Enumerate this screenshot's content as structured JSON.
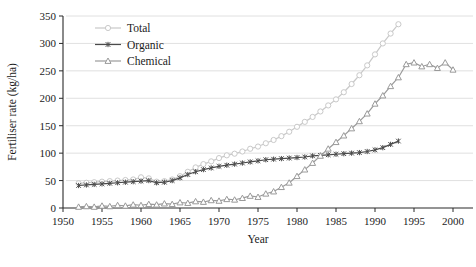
{
  "chart_data": {
    "type": "line",
    "title": "",
    "xlabel": "Year",
    "ylabel": "Fertiliser rate (kg/ha)",
    "xlim": [
      1950,
      2000
    ],
    "ylim": [
      0,
      350
    ],
    "xticks": [
      1950,
      1955,
      1960,
      1965,
      1970,
      1975,
      1980,
      1985,
      1990,
      1995,
      2000
    ],
    "yticks": [
      0,
      50,
      100,
      150,
      200,
      250,
      300,
      350
    ],
    "grid": "horizontal",
    "legend_position": "top-left",
    "series": [
      {
        "name": "Total",
        "color": "#c9c9c9",
        "marker": "circle",
        "x": [
          1952,
          1953,
          1954,
          1955,
          1956,
          1957,
          1958,
          1959,
          1960,
          1961,
          1962,
          1963,
          1964,
          1965,
          1966,
          1967,
          1968,
          1969,
          1970,
          1971,
          1972,
          1973,
          1974,
          1975,
          1976,
          1977,
          1978,
          1979,
          1980,
          1981,
          1982,
          1983,
          1984,
          1985,
          1986,
          1987,
          1988,
          1989,
          1990,
          1991,
          1992,
          1993
        ],
        "values": [
          45,
          46,
          47,
          48,
          49,
          50,
          51,
          52,
          56,
          54,
          48,
          49,
          52,
          58,
          66,
          74,
          80,
          85,
          91,
          96,
          99,
          103,
          108,
          112,
          118,
          124,
          131,
          139,
          148,
          157,
          166,
          176,
          187,
          198,
          211,
          226,
          242,
          260,
          280,
          300,
          318,
          335
        ]
      },
      {
        "name": "Organic",
        "color": "#4a4a4a",
        "marker": "star",
        "x": [
          1952,
          1953,
          1954,
          1955,
          1956,
          1957,
          1958,
          1959,
          1960,
          1961,
          1962,
          1963,
          1964,
          1965,
          1966,
          1967,
          1968,
          1969,
          1970,
          1971,
          1972,
          1973,
          1974,
          1975,
          1976,
          1977,
          1978,
          1979,
          1980,
          1981,
          1982,
          1983,
          1984,
          1985,
          1986,
          1987,
          1988,
          1989,
          1990,
          1991,
          1992,
          1993
        ],
        "values": [
          41,
          42,
          43,
          44,
          45,
          46,
          47,
          48,
          49,
          50,
          46,
          47,
          50,
          55,
          61,
          66,
          70,
          73,
          76,
          78,
          80,
          82,
          84,
          86,
          88,
          89,
          90,
          91,
          92,
          93,
          95,
          96,
          97,
          98,
          99,
          100,
          101,
          103,
          106,
          110,
          116,
          122
        ]
      },
      {
        "name": "Chemical",
        "color": "#9a9a9a",
        "marker": "triangle",
        "x": [
          1952,
          1953,
          1954,
          1955,
          1956,
          1957,
          1958,
          1959,
          1960,
          1961,
          1962,
          1963,
          1964,
          1965,
          1966,
          1967,
          1968,
          1969,
          1970,
          1971,
          1972,
          1973,
          1974,
          1975,
          1976,
          1977,
          1978,
          1979,
          1980,
          1981,
          1982,
          1983,
          1984,
          1985,
          1986,
          1987,
          1988,
          1989,
          1990,
          1991,
          1992,
          1993,
          1994,
          1995,
          1996,
          1997,
          1998,
          1999,
          2000
        ],
        "values": [
          2,
          3,
          2,
          4,
          3,
          5,
          4,
          6,
          5,
          7,
          6,
          8,
          7,
          10,
          9,
          12,
          11,
          14,
          13,
          16,
          15,
          18,
          22,
          20,
          26,
          30,
          38,
          46,
          58,
          70,
          82,
          95,
          108,
          120,
          132,
          145,
          158,
          172,
          190,
          205,
          222,
          238,
          262,
          265,
          258,
          262,
          255,
          265,
          252
        ]
      }
    ]
  }
}
